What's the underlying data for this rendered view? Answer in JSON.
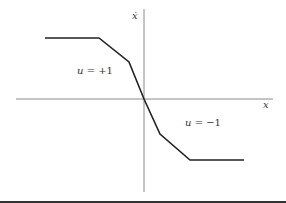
{
  "figure": {
    "axes": {
      "x_label": "x",
      "y_label": "ẋ"
    },
    "regions": [
      {
        "var": "u",
        "eq": " = ",
        "value": "+1"
      },
      {
        "var": "u",
        "eq": " = ",
        "value": "−1"
      }
    ],
    "switching_curve": {
      "points": [
        [
          45,
          38
        ],
        [
          99,
          38
        ],
        [
          129,
          62
        ],
        [
          144,
          99
        ],
        [
          160,
          134
        ],
        [
          190,
          160
        ],
        [
          244,
          160
        ]
      ]
    },
    "colors": {
      "axis": "#8a8a8a",
      "curve": "#222222",
      "text": "#333333"
    }
  }
}
